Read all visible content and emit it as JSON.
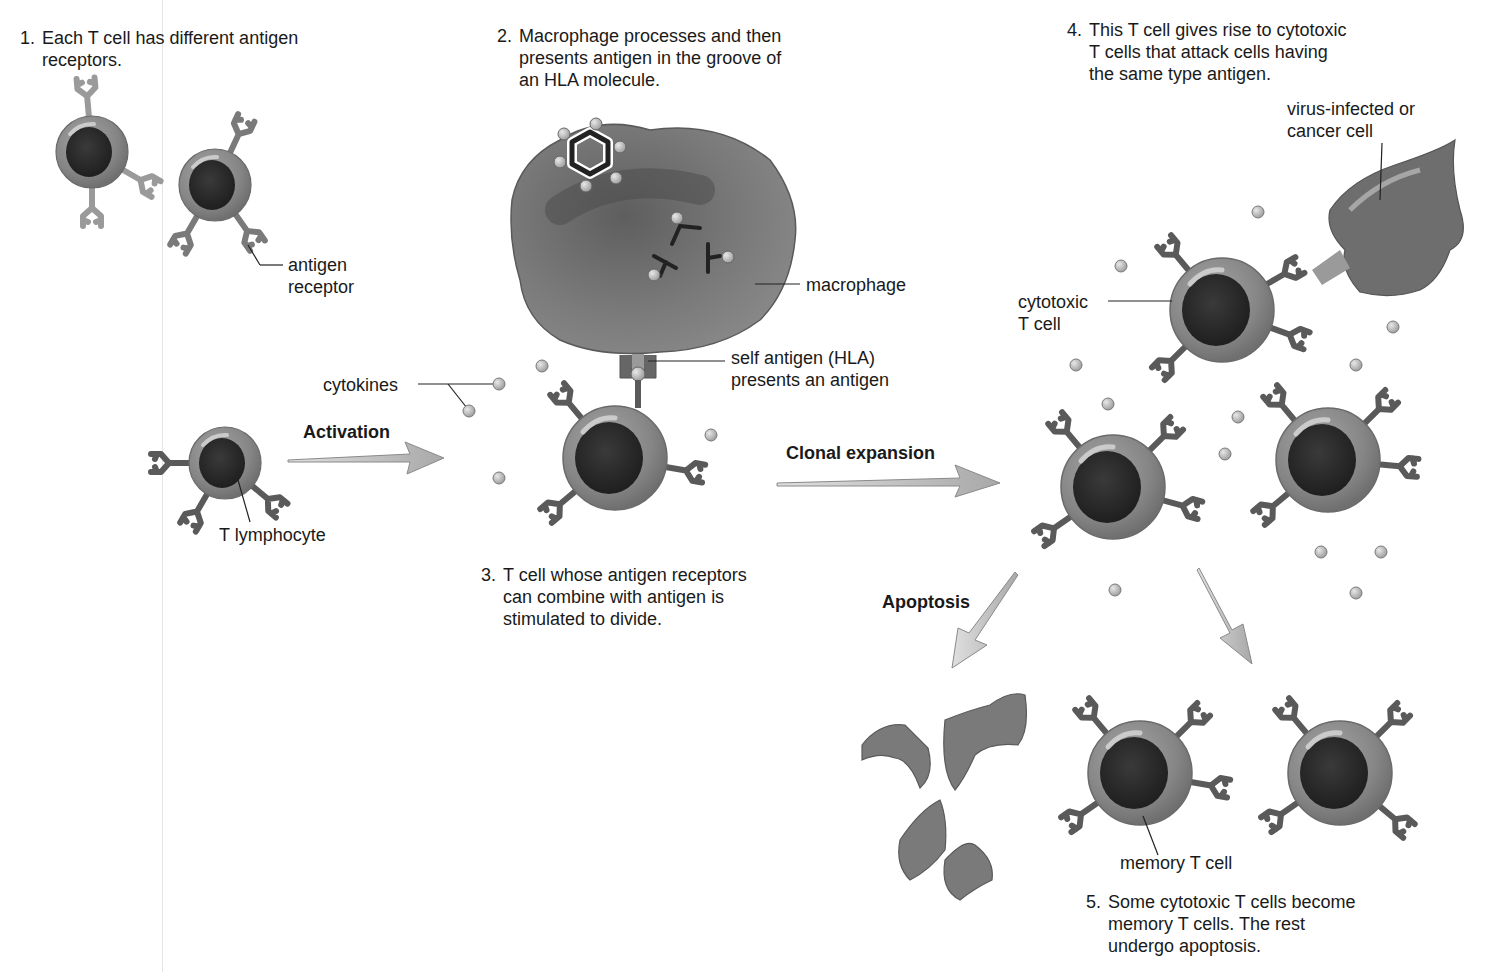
{
  "steps": {
    "step1": {
      "number": "1.",
      "text": "Each T cell has different antigen\nreceptors."
    },
    "step2": {
      "number": "2.",
      "text": "Macrophage processes and then\npresents antigen in the groove of\nan HLA molecule."
    },
    "step3": {
      "number": "3.",
      "text": "T cell whose antigen receptors\ncan combine with antigen is\nstimulated to divide."
    },
    "step4": {
      "number": "4.",
      "text": "This T cell gives rise to cytotoxic\nT cells that attack cells having\nthe same type antigen."
    },
    "step5": {
      "number": "5.",
      "text": "Some cytotoxic T cells become\nmemory T cells. The rest\nundergo apoptosis."
    }
  },
  "labels": {
    "antigen_receptor": "antigen\nreceptor",
    "macrophage": "macrophage",
    "self_antigen": "self antigen (HLA)\npresents an antigen",
    "cytokines": "cytokines",
    "t_lymphocyte": "T lymphocyte",
    "cytotoxic_t_cell": "cytotoxic\nT cell",
    "virus_infected": "virus-infected or\ncancer cell",
    "memory_t_cell": "memory T cell"
  },
  "process_arrows": {
    "activation": "Activation",
    "clonal_expansion": "Clonal expansion",
    "apoptosis": "Apoptosis"
  },
  "colors": {
    "cell_body": "#8a8a8a",
    "nucleus": "#2e2e2e",
    "receptor": "#5a5a5a",
    "receptor_light": "#9a9a9a",
    "macrophage": "#7c7c7c",
    "arrow_fill": "#bdbdbd",
    "cytokine": "#b5b5b5"
  }
}
